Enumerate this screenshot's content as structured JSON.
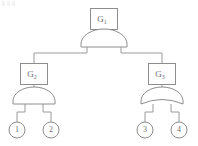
{
  "diagram": {
    "type": "fault-tree",
    "background_color": "#ffffff",
    "stroke_color": "#8d8d8d",
    "wire_color": "#9a9a9a",
    "text_color": "#6e6e6e",
    "gates": [
      {
        "id": "G1",
        "label_base": "G",
        "label_sub": "1",
        "gate_type": "AND",
        "level": "top",
        "box": {
          "x": 90,
          "y": 8,
          "width": 28,
          "height": 22
        },
        "shape": {
          "cx": 104,
          "cy": 47,
          "rx": 23,
          "ry": 15
        }
      },
      {
        "id": "G2",
        "label_base": "G",
        "label_sub": "2",
        "gate_type": "AND",
        "level": "middle-left",
        "box": {
          "x": 20,
          "y": 63,
          "width": 28,
          "height": 22
        },
        "shape": {
          "cx": 34,
          "cy": 104,
          "rx": 22,
          "ry": 14
        }
      },
      {
        "id": "G3",
        "label_base": "G",
        "label_sub": "3",
        "gate_type": "OR",
        "level": "middle-right",
        "box": {
          "x": 148,
          "y": 63,
          "width": 28,
          "height": 22
        },
        "shape": {
          "cx": 162,
          "cy": 104,
          "rx": 22,
          "ry": 14
        }
      }
    ],
    "basic_events": [
      {
        "id": "E1",
        "label": "1",
        "cx": 17,
        "cy": 130,
        "r": 8,
        "parent": "G2"
      },
      {
        "id": "E2",
        "label": "2",
        "cx": 51,
        "cy": 130,
        "r": 8,
        "parent": "G2"
      },
      {
        "id": "E3",
        "label": "3",
        "cx": 145,
        "cy": 130,
        "r": 8,
        "parent": "G3"
      },
      {
        "id": "E4",
        "label": "4",
        "cx": 179,
        "cy": 130,
        "r": 8,
        "parent": "G3"
      }
    ],
    "connections": [
      {
        "from": "G1-box",
        "to": "G1-gate"
      },
      {
        "from": "G1-gate",
        "to": "G2-box"
      },
      {
        "from": "G1-gate",
        "to": "G3-box"
      },
      {
        "from": "G2-box",
        "to": "G2-gate"
      },
      {
        "from": "G3-box",
        "to": "G3-gate"
      },
      {
        "from": "G2-gate",
        "to": "E1"
      },
      {
        "from": "G2-gate",
        "to": "E2"
      },
      {
        "from": "G3-gate",
        "to": "E3"
      },
      {
        "from": "G3-gate",
        "to": "E4"
      }
    ]
  }
}
